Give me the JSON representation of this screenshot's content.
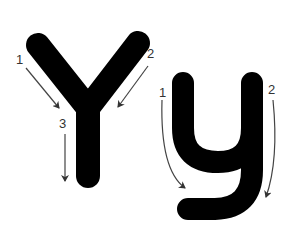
{
  "diagram": {
    "uppercase": {
      "letter": "Y",
      "strokes": [
        {
          "order": "1",
          "label": "1",
          "direction": "down-right"
        },
        {
          "order": "2",
          "label": "2",
          "direction": "down-left"
        },
        {
          "order": "3",
          "label": "3",
          "direction": "down"
        }
      ]
    },
    "lowercase": {
      "letter": "y",
      "strokes": [
        {
          "order": "1",
          "label": "1",
          "direction": "down-curve-right"
        },
        {
          "order": "2",
          "label": "2",
          "direction": "down-curve"
        }
      ]
    },
    "colors": {
      "letter_fill": "#000000",
      "arrow": "#444444",
      "label": "#333333",
      "background": "#ffffff"
    }
  }
}
